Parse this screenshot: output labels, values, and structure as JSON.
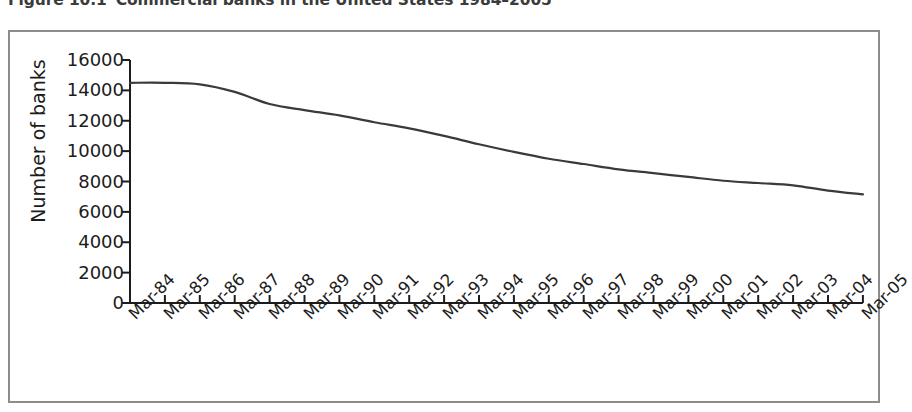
{
  "title": {
    "figure_number": "Figure 10.1",
    "text": "Commercial banks in the United States 1984–2005"
  },
  "colors": {
    "line": "#3a3a3a",
    "axis": "#1c1c1c",
    "frame": "#8c8c8c",
    "text": "#1c1c1c",
    "title_text": "#3b3b3b",
    "background": "#ffffff"
  },
  "chart_data": {
    "type": "line",
    "title": "Commercial banks in the United States 1984–2005",
    "xlabel": "",
    "ylabel": "Number of banks",
    "ylim": [
      0,
      16000
    ],
    "ytick_labels": [
      "16000",
      "14000",
      "12000",
      "10000",
      "8000",
      "6000",
      "4000",
      "2000",
      "0"
    ],
    "ytick_values": [
      16000,
      14000,
      12000,
      10000,
      8000,
      6000,
      4000,
      2000,
      0
    ],
    "grid": false,
    "legend": false,
    "categories": [
      "Mar-84",
      "Mar-85",
      "Mar-86",
      "Mar-87",
      "Mar-88",
      "Mar-89",
      "Mar-90",
      "Mar-91",
      "Mar-92",
      "Mar-93",
      "Mar-94",
      "Mar-95",
      "Mar-96",
      "Mar-97",
      "Mar-98",
      "Mar-99",
      "Mar-00",
      "Mar-01",
      "Mar-02",
      "Mar-03",
      "Mar-04",
      "Mar-05"
    ],
    "series": [
      {
        "name": "Number of banks",
        "values": [
          14500,
          14500,
          14400,
          13900,
          13100,
          12700,
          12350,
          11900,
          11500,
          11000,
          10450,
          9950,
          9500,
          9150,
          8800,
          8550,
          8300,
          8050,
          7900,
          7750,
          7400,
          7150
        ]
      }
    ]
  }
}
